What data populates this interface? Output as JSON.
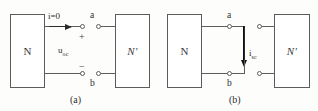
{
  "figure": {
    "line_color": "#5c5c5c",
    "arrow_color": "#111111",
    "text_color": "#2e2e2e"
  },
  "panel_a": {
    "caption": "(a)",
    "network_left_label": "N",
    "network_right_label": "N′",
    "current_label": "i",
    "current_value": "=0",
    "current_label_full": "i=0",
    "voltage_symbol": "u",
    "voltage_subscript": "oc",
    "voltage_label_full": "u_oc",
    "polarity_plus": "+",
    "polarity_minus": "−",
    "terminal_top": "a",
    "terminal_bottom": "b"
  },
  "panel_b": {
    "caption": "(b)",
    "network_left_label": "N",
    "network_right_label": "N′",
    "current_symbol": "i",
    "current_subscript": "sc",
    "current_label_full": "i_sc",
    "terminal_top": "a",
    "terminal_bottom": "b"
  }
}
